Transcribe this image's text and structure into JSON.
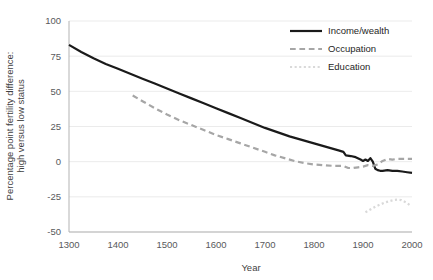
{
  "chart_data": {
    "type": "line",
    "title": "",
    "xlabel": "Year",
    "ylabel_line1": "Percentage point fertility difference:",
    "ylabel_line2": "high versus low status",
    "xlim": [
      1300,
      2000
    ],
    "ylim": [
      -50,
      100
    ],
    "xticks": [
      1300,
      1400,
      1500,
      1600,
      1700,
      1800,
      1900,
      2000
    ],
    "xtick_labels": [
      "1300",
      "1400",
      "1500",
      "1600",
      "1700",
      "1800",
      "1900",
      "2000"
    ],
    "yticks": [
      -50,
      -25,
      0,
      25,
      50,
      75,
      100
    ],
    "ytick_labels": [
      "-50",
      "-25",
      "0",
      "25",
      "50",
      "75",
      "100"
    ],
    "grid": true,
    "legend_position": "top-right",
    "series": [
      {
        "name": "Income/wealth",
        "style": "solid",
        "color": "#1a1a1a",
        "width": 2.2,
        "points": [
          [
            1300,
            83
          ],
          [
            1325,
            78
          ],
          [
            1350,
            73.5
          ],
          [
            1375,
            69.5
          ],
          [
            1400,
            66
          ],
          [
            1425,
            62.5
          ],
          [
            1450,
            59
          ],
          [
            1475,
            55.5
          ],
          [
            1500,
            52
          ],
          [
            1525,
            48.5
          ],
          [
            1550,
            45
          ],
          [
            1575,
            41.5
          ],
          [
            1600,
            38
          ],
          [
            1625,
            34.5
          ],
          [
            1650,
            31
          ],
          [
            1675,
            27.5
          ],
          [
            1700,
            24
          ],
          [
            1725,
            21
          ],
          [
            1750,
            18
          ],
          [
            1775,
            15.5
          ],
          [
            1800,
            13
          ],
          [
            1825,
            10.5
          ],
          [
            1850,
            8
          ],
          [
            1860,
            7
          ],
          [
            1865,
            4.5
          ],
          [
            1875,
            4
          ],
          [
            1885,
            3.2
          ],
          [
            1895,
            1.5
          ],
          [
            1900,
            0.5
          ],
          [
            1905,
            1.5
          ],
          [
            1910,
            0.5
          ],
          [
            1915,
            2.5
          ],
          [
            1920,
            0
          ],
          [
            1925,
            -5
          ],
          [
            1930,
            -6
          ],
          [
            1935,
            -6.5
          ],
          [
            1940,
            -6.5
          ],
          [
            1950,
            -6
          ],
          [
            1960,
            -6.5
          ],
          [
            1970,
            -6.5
          ],
          [
            1980,
            -7
          ],
          [
            1990,
            -7.5
          ],
          [
            2000,
            -8
          ]
        ]
      },
      {
        "name": "Occupation",
        "style": "dashed",
        "color": "#a6a6a6",
        "width": 2.2,
        "points": [
          [
            1430,
            47
          ],
          [
            1450,
            43
          ],
          [
            1475,
            38
          ],
          [
            1500,
            33.5
          ],
          [
            1525,
            29.5
          ],
          [
            1550,
            26
          ],
          [
            1575,
            22.5
          ],
          [
            1600,
            19
          ],
          [
            1625,
            16
          ],
          [
            1650,
            13
          ],
          [
            1675,
            10
          ],
          [
            1700,
            7
          ],
          [
            1720,
            4.5
          ],
          [
            1740,
            2.5
          ],
          [
            1760,
            0.5
          ],
          [
            1780,
            -1
          ],
          [
            1800,
            -2
          ],
          [
            1820,
            -2.5
          ],
          [
            1840,
            -3
          ],
          [
            1860,
            -3
          ],
          [
            1870,
            -4.5
          ],
          [
            1880,
            -4.5
          ],
          [
            1890,
            -4
          ],
          [
            1900,
            -3.5
          ],
          [
            1910,
            -2.5
          ],
          [
            1920,
            -3
          ],
          [
            1930,
            -2
          ],
          [
            1940,
            0.5
          ],
          [
            1950,
            2
          ],
          [
            1960,
            1.5
          ],
          [
            1970,
            2
          ],
          [
            1980,
            2
          ],
          [
            1990,
            2
          ],
          [
            2000,
            2
          ]
        ]
      },
      {
        "name": "Education",
        "style": "dotted",
        "color": "#d9d9d9",
        "width": 2.2,
        "points": [
          [
            1905,
            -36
          ],
          [
            1915,
            -34
          ],
          [
            1925,
            -32
          ],
          [
            1935,
            -30.5
          ],
          [
            1945,
            -29
          ],
          [
            1955,
            -28
          ],
          [
            1962,
            -27.3
          ],
          [
            1970,
            -27
          ],
          [
            1978,
            -27.3
          ],
          [
            1985,
            -28.5
          ],
          [
            1992,
            -30
          ],
          [
            1998,
            -31.5
          ]
        ]
      }
    ],
    "legend_entries": [
      {
        "label": "Income/wealth",
        "style": "solid",
        "color": "#1a1a1a"
      },
      {
        "label": "Occupation",
        "style": "dashed",
        "color": "#a6a6a6"
      },
      {
        "label": "Education",
        "style": "dotted",
        "color": "#d9d9d9"
      }
    ]
  }
}
